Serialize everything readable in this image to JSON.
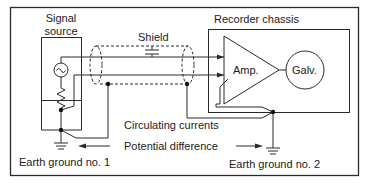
{
  "diagram": {
    "type": "circuit-schematic",
    "labels": {
      "signal_source_line1": "Signal",
      "signal_source_line2": "source",
      "shield": "Shield",
      "recorder_chassis": "Recorder chassis",
      "amplifier": "Amp.",
      "galvanometer": "Galv.",
      "circulating_currents": "Circulating currents",
      "potential_difference": "Potential difference",
      "earth_ground_1": "Earth ground no. 1",
      "earth_ground_2": "Earth ground no. 2"
    },
    "components": [
      {
        "id": "signal-source",
        "kind": "ac-source-with-resistor"
      },
      {
        "id": "shielded-cable",
        "kind": "shielded-twin-lead"
      },
      {
        "id": "shield-capacitance",
        "kind": "capacitor"
      },
      {
        "id": "amplifier",
        "kind": "triangle-amplifier"
      },
      {
        "id": "galvanometer",
        "kind": "circle-meter"
      },
      {
        "id": "earth-ground-1",
        "kind": "ground"
      },
      {
        "id": "earth-ground-2",
        "kind": "ground"
      }
    ],
    "colors": {
      "line": "#2a2a2a",
      "text": "#1a1a1a",
      "background": "#ffffff"
    }
  }
}
